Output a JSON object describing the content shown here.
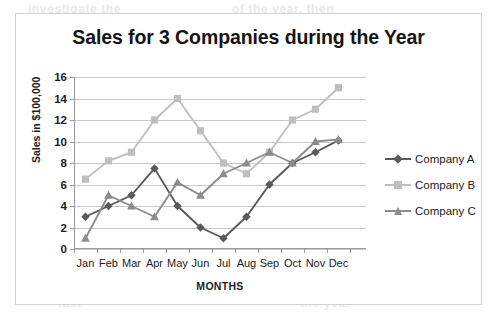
{
  "frame": {
    "border_color": "#d2d2d2"
  },
  "bleed_text": [
    {
      "text": "investigate the",
      "x": 28,
      "y": 2
    },
    {
      "text": "of the year, then",
      "x": 232,
      "y": 2
    },
    {
      "text": "of the 3 then look",
      "x": 22,
      "y": 14
    },
    {
      "text": "and then, all analyze",
      "x": 150,
      "y": 14
    },
    {
      "text": "at the year they",
      "x": 330,
      "y": 14
    },
    {
      "text": "the sales",
      "x": 60,
      "y": 62
    },
    {
      "text": "compared to the",
      "x": 150,
      "y": 62
    },
    {
      "text": "graph",
      "x": 330,
      "y": 62
    },
    {
      "text": "for the",
      "x": 70,
      "y": 74
    },
    {
      "text": "3 companies",
      "x": 160,
      "y": 74
    },
    {
      "text": "in the year",
      "x": 300,
      "y": 74
    },
    {
      "text": "Company B was",
      "x": 90,
      "y": 182
    },
    {
      "text": "the best in sales",
      "x": 250,
      "y": 182
    },
    {
      "text": "Company A",
      "x": 120,
      "y": 232
    },
    {
      "text": "lowest in sales",
      "x": 260,
      "y": 232
    },
    {
      "text": "fast",
      "x": 58,
      "y": 296
    },
    {
      "text": "the year",
      "x": 300,
      "y": 296
    }
  ],
  "chart_data": {
    "type": "line",
    "title": "Sales for 3 Companies during the Year",
    "xlabel": "MONTHS",
    "ylabel": "Sales in $100,000",
    "categories": [
      "Jan",
      "Feb",
      "Mar",
      "Apr",
      "May",
      "Jun",
      "Jul",
      "Aug",
      "Sep",
      "Oct",
      "Nov",
      "Dec"
    ],
    "ylim": [
      0,
      16
    ],
    "ytick_step": 2,
    "yticks": [
      0,
      2,
      4,
      6,
      8,
      10,
      12,
      14,
      16
    ],
    "grid": true,
    "grid_axis": "y",
    "legend_position": "right",
    "x_padding_right_fraction": 0.055,
    "series": [
      {
        "name": "Company A",
        "color": "#595959",
        "marker": "diamond",
        "values": [
          3,
          4,
          5,
          7.5,
          4,
          2,
          1,
          3,
          6,
          8,
          9,
          10.1
        ]
      },
      {
        "name": "Company B",
        "color": "#bfbfbf",
        "marker": "square",
        "values": [
          6.5,
          8.2,
          9,
          12,
          14,
          11,
          8,
          7,
          9,
          12,
          13,
          15
        ]
      },
      {
        "name": "Company C",
        "color": "#8c8c8c",
        "marker": "triangle",
        "values": [
          1,
          5,
          4,
          3,
          6.2,
          5,
          7,
          8,
          9,
          8,
          10,
          10.2
        ]
      }
    ]
  }
}
